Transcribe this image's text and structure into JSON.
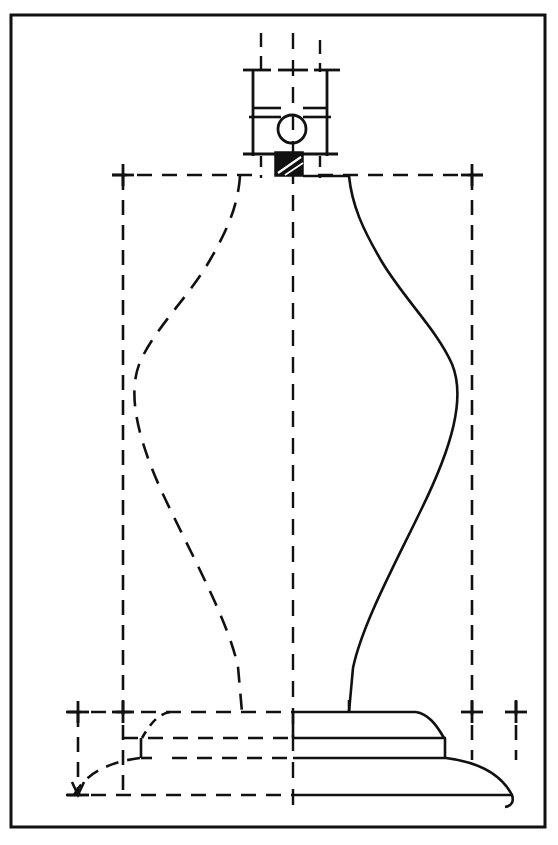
{
  "document": {
    "type": "technical-drawing",
    "subject": "turned lamp base / baluster vase profile",
    "view": "front elevation with construction geometry",
    "canvas": {
      "width": 558,
      "height": 845
    },
    "background_color": "#ffffff",
    "ink_color": "#111111"
  },
  "frame": {
    "name": "drawing-border",
    "x": 11,
    "y": 15,
    "width": 534,
    "height": 812,
    "stroke_width": 3,
    "color": "#111111"
  },
  "line_styles": {
    "visible_outline": {
      "label": "solid object line",
      "dash": "none",
      "width": 2.6
    },
    "hidden_outline": {
      "label": "dashed hidden line",
      "dash": "14 9",
      "width": 2.6
    },
    "construction": {
      "label": "dashed construction line",
      "dash": "15 10",
      "width": 2.6
    },
    "center_axis": {
      "label": "dashed centre line",
      "dash": "16 11",
      "width": 2.4
    }
  },
  "geometry": {
    "center_axis_x": 293,
    "construction_box": {
      "left_x": 123,
      "right_x": 472,
      "top_y": 175,
      "bottom_y": 712
    },
    "outer_tick_axis": {
      "left_x": 78,
      "right_x": 516,
      "y": 712
    },
    "baseline_y": 795,
    "body": {
      "neck_top_y": 175,
      "neck_half_width": 57,
      "max_bulge_y": 370,
      "max_bulge_half_width": 179,
      "waist_y": 250,
      "foot_y": 712,
      "stem_half_width": 48
    },
    "cap_block": {
      "x": 253,
      "y": 70,
      "width": 74,
      "height": 86,
      "inner_rail_y1": 107,
      "inner_rail_y2": 115,
      "bore_circle": {
        "cx": 292,
        "cy": 129,
        "r": 14
      }
    },
    "hatched_tenon": {
      "x": 275,
      "y": 152,
      "width": 28,
      "height": 24,
      "fill": "#111111",
      "hatch_color": "#ffffff"
    },
    "base": {
      "plinth_top_y": 712,
      "plinth_mid_y": 738,
      "plinth_step_y": 758,
      "skirt_bottom_y": 795,
      "plinth_right_x": 416,
      "step_right_x": 446,
      "skirt_right_x": 512
    }
  },
  "tick_marks": {
    "name": "dimension-cross-ticks",
    "size": 11,
    "points": [
      {
        "x": 78,
        "y": 712
      },
      {
        "x": 123,
        "y": 712
      },
      {
        "x": 123,
        "y": 175
      },
      {
        "x": 472,
        "y": 175
      },
      {
        "x": 472,
        "y": 712
      },
      {
        "x": 516,
        "y": 712
      },
      {
        "x": 78,
        "y": 795
      }
    ]
  },
  "annotations": {
    "has_text_labels": false,
    "has_dimension_numbers": false,
    "note": ""
  }
}
